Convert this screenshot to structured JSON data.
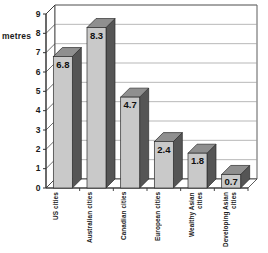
{
  "chart_data": {
    "type": "bar",
    "title": "",
    "subtitle": "",
    "xlabel": "",
    "ylabel": "metres",
    "ylim": [
      0,
      9
    ],
    "ytick_step": 1,
    "grid": true,
    "legend": "none",
    "style": "3d-column",
    "categories": [
      "US cities",
      "Australian cities",
      "Canadian cities",
      "European cities",
      "Wealthy Asian cities",
      "Developing Asian cities"
    ],
    "values": [
      6.8,
      8.3,
      4.7,
      2.4,
      1.8,
      0.7
    ],
    "value_labels": [
      "6.8",
      "8.3",
      "4.7",
      "2.4",
      "1.8",
      "0.7"
    ],
    "yticks": [
      "0",
      "1",
      "2",
      "3",
      "4",
      "5",
      "6",
      "7",
      "8",
      "9"
    ]
  },
  "colors": {
    "bar_front": "#c9c9c9",
    "bar_side": "#555555",
    "bar_top": "#8f8f8f",
    "axis": "#333333",
    "grid": "#999999",
    "text": "#1a1a1a",
    "background": "#ffffff"
  },
  "axis": {
    "y_unit_label": "metres"
  }
}
